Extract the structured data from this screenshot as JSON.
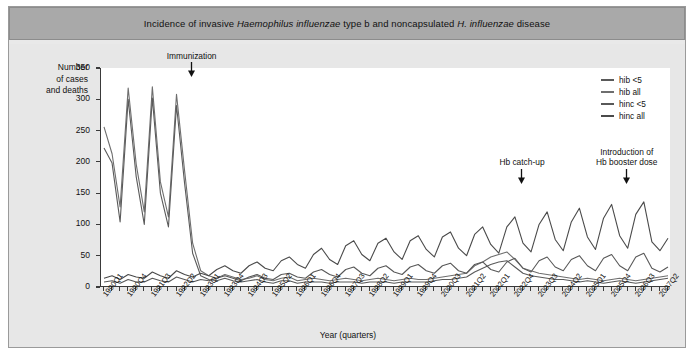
{
  "figure": {
    "title_prefix": "Incidence of invasive ",
    "title_italic_1": "Haemophilus influenzae",
    "title_mid": " type b and noncapsulated ",
    "title_italic_2": "H. influenzae",
    "title_suffix": " disease",
    "title_plain": "Incidence of invasive Haemophilus influenzae type b and noncapsulated H. influenzae disease"
  },
  "axes": {
    "ylabel_line1": "Number",
    "ylabel_line2": "of cases",
    "ylabel_line3": "and deaths",
    "xlabel": "Year (quarters)"
  },
  "legend": {
    "position": "top-right",
    "items": [
      {
        "label": "hib <5",
        "color": "#5a5a5a"
      },
      {
        "label": "hib all",
        "color": "#6e6e6e"
      },
      {
        "label": "hinc <5",
        "color": "#585858"
      },
      {
        "label": "hinc all",
        "color": "#4a4a4a"
      }
    ]
  },
  "annotations": [
    {
      "name": "immunization",
      "lines": [
        "Immunization"
      ],
      "x_quarter": "1992Q4",
      "y_value": 348
    },
    {
      "name": "hb-catch-up",
      "lines": [
        "Hb catch-up"
      ],
      "x_quarter": "2003Q1",
      "y_value": 178
    },
    {
      "name": "hb-booster",
      "lines": [
        "Introduction of",
        "Hb booster dose"
      ],
      "x_quarter": "2006Q2",
      "y_value": 178
    }
  ],
  "colors": {
    "panel_bg": "#e7e7e7",
    "plot_bg": "#ffffff",
    "titlebar_bg": "#a9a9a9",
    "axis": "#3a3a3a",
    "card_border": "#9a9a9a"
  },
  "chart_data": {
    "type": "line",
    "title": "Incidence of invasive Haemophilus influenzae type b and noncapsulated H. influenzae disease",
    "xlabel": "Year (quarters)",
    "ylabel": "Number of cases and deaths",
    "ylim": [
      0,
      350
    ],
    "yticks": [
      0,
      50,
      100,
      150,
      200,
      250,
      300,
      350
    ],
    "grid": false,
    "legend_position": "top-right",
    "x_tick_label_every": 3,
    "x": [
      "1990Q1",
      "1990Q2",
      "1990Q3",
      "1990Q4",
      "1991Q1",
      "1991Q2",
      "1991Q3",
      "1991Q4",
      "1992Q1",
      "1992Q2",
      "1992Q3",
      "1992Q4",
      "1993Q1",
      "1993Q2",
      "1993Q3",
      "1993Q4",
      "1994Q1",
      "1994Q2",
      "1994Q3",
      "1994Q4",
      "1995Q1",
      "1995Q2",
      "1995Q3",
      "1995Q4",
      "1996Q1",
      "1996Q2",
      "1996Q3",
      "1996Q4",
      "1997Q1",
      "1997Q2",
      "1997Q3",
      "1997Q4",
      "1998Q1",
      "1998Q2",
      "1998Q3",
      "1998Q4",
      "1999Q1",
      "1999Q2",
      "1999Q3",
      "1999Q4",
      "2000Q1",
      "2000Q2",
      "2000Q3",
      "2000Q4",
      "2001Q1",
      "2001Q2",
      "2001Q3",
      "2001Q4",
      "2002Q1",
      "2002Q2",
      "2002Q3",
      "2002Q4",
      "2003Q1",
      "2003Q2",
      "2003Q3",
      "2003Q4",
      "2004Q1",
      "2004Q2",
      "2004Q3",
      "2004Q4",
      "2005Q1",
      "2005Q2",
      "2005Q3",
      "2005Q4",
      "2006Q1",
      "2006Q2",
      "2006Q3",
      "2006Q4",
      "2007Q1",
      "2007Q2",
      "2007Q3"
    ],
    "x_tick_labels": [
      "1990Q1",
      "1990Q4",
      "1991Q3",
      "1992Q2",
      "1993Q1",
      "1993Q4",
      "1994Q3",
      "1995Q2",
      "1996Q1",
      "1996Q4",
      "1997Q3",
      "1998Q2",
      "1999Q1",
      "1999Q4",
      "2000Q3",
      "2001Q2",
      "2002Q1",
      "2002Q4",
      "2003Q3",
      "2004Q2",
      "2005Q1",
      "2005Q4",
      "2006Q3",
      "2007Q2"
    ],
    "series": [
      {
        "name": "hib all",
        "color": "#6e6e6e",
        "values": [
          256,
          213,
          128,
          318,
          196,
          120,
          320,
          168,
          112,
          308,
          186,
          70,
          26,
          18,
          14,
          20,
          16,
          12,
          14,
          18,
          12,
          10,
          14,
          16,
          10,
          12,
          14,
          12,
          10,
          12,
          14,
          12,
          10,
          12,
          14,
          12,
          10,
          12,
          14,
          12,
          12,
          14,
          16,
          18,
          20,
          22,
          34,
          40,
          48,
          52,
          56,
          44,
          30,
          26,
          22,
          20,
          18,
          16,
          14,
          12,
          14,
          12,
          10,
          12,
          14,
          12,
          10,
          12,
          14,
          16,
          18
        ]
      },
      {
        "name": "hib <5",
        "color": "#5a5a5a",
        "values": [
          222,
          198,
          104,
          300,
          176,
          100,
          302,
          150,
          96,
          290,
          166,
          54,
          18,
          12,
          10,
          14,
          10,
          8,
          10,
          12,
          8,
          6,
          10,
          10,
          6,
          8,
          8,
          8,
          6,
          8,
          8,
          8,
          6,
          8,
          8,
          8,
          6,
          8,
          8,
          8,
          8,
          10,
          12,
          12,
          14,
          16,
          24,
          30,
          36,
          40,
          42,
          32,
          22,
          18,
          16,
          14,
          12,
          12,
          10,
          8,
          10,
          8,
          6,
          8,
          10,
          8,
          6,
          8,
          10,
          12,
          14
        ]
      },
      {
        "name": "hinc all",
        "color": "#4a4a4a",
        "values": [
          14,
          18,
          12,
          20,
          16,
          14,
          24,
          18,
          14,
          26,
          20,
          16,
          22,
          18,
          28,
          34,
          26,
          22,
          34,
          40,
          30,
          26,
          42,
          48,
          36,
          30,
          52,
          62,
          44,
          36,
          66,
          74,
          52,
          42,
          70,
          78,
          56,
          44,
          74,
          82,
          60,
          48,
          80,
          88,
          62,
          50,
          84,
          96,
          68,
          54,
          96,
          112,
          70,
          56,
          100,
          120,
          76,
          58,
          104,
          126,
          80,
          60,
          110,
          132,
          82,
          62,
          116,
          136,
          72,
          58,
          78
        ]
      },
      {
        "name": "hinc <5",
        "color": "#585858",
        "values": [
          8,
          10,
          6,
          12,
          8,
          8,
          14,
          10,
          8,
          16,
          12,
          8,
          12,
          10,
          14,
          18,
          14,
          10,
          16,
          20,
          14,
          12,
          20,
          22,
          16,
          14,
          24,
          28,
          20,
          16,
          28,
          32,
          22,
          18,
          30,
          34,
          24,
          20,
          32,
          36,
          26,
          22,
          34,
          38,
          26,
          22,
          36,
          40,
          28,
          24,
          40,
          46,
          30,
          24,
          42,
          48,
          32,
          26,
          44,
          50,
          34,
          26,
          46,
          52,
          34,
          26,
          48,
          54,
          30,
          24,
          32
        ]
      }
    ]
  }
}
